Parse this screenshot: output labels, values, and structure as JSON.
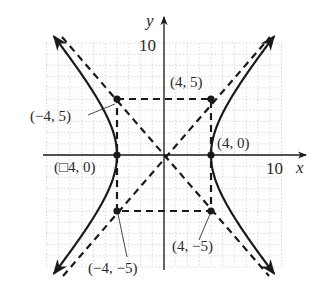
{
  "chart_data": {
    "type": "line",
    "title": "",
    "equation": "x^2/16 - y^2/25 = 1",
    "xlabel": "x",
    "ylabel": "y",
    "xlim": [
      -10,
      10
    ],
    "ylim": [
      -10,
      10
    ],
    "grid": true,
    "tick_labels": {
      "x": [
        "10"
      ],
      "y": [
        "10"
      ]
    },
    "series": [
      {
        "name": "hyperbola-right-branch",
        "style": "solid",
        "vertex": [
          4,
          0
        ]
      },
      {
        "name": "hyperbola-left-branch",
        "style": "solid",
        "vertex": [
          -4,
          0
        ]
      },
      {
        "name": "asymptote-positive",
        "style": "dashed",
        "slope": 1.25,
        "equation": "y = 5/4 x"
      },
      {
        "name": "asymptote-negative",
        "style": "dashed",
        "slope": -1.25,
        "equation": "y = -5/4 x"
      },
      {
        "name": "fundamental-rectangle",
        "style": "dashed",
        "corners": [
          [
            -4,
            5
          ],
          [
            4,
            5
          ],
          [
            4,
            -5
          ],
          [
            -4,
            -5
          ]
        ]
      }
    ],
    "points": [
      {
        "x": -4,
        "y": 5,
        "label": "(−4, 5)"
      },
      {
        "x": 4,
        "y": 5,
        "label": "(4, 5)"
      },
      {
        "x": 4,
        "y": 0,
        "label": "(4, 0)"
      },
      {
        "x": -4,
        "y": 0,
        "label": "(□4, 0)"
      },
      {
        "x": -4,
        "y": -5,
        "label": "(−4, −5)"
      },
      {
        "x": 4,
        "y": -5,
        "label": "(4, −5)"
      }
    ]
  },
  "labels": {
    "x_axis": "x",
    "y_axis": "y",
    "x_tick": "10",
    "y_tick": "10",
    "p_m4_5": "(−4, 5)",
    "p_4_5": "(4, 5)",
    "p_4_0": "(4, 0)",
    "p_m4_0": "(□4, 0)",
    "p_m4_m5": "(−4, −5)",
    "p_4_m5": "(4, −5)"
  },
  "colors": {
    "ink": "#1a1a1a",
    "grid": "#c8c8c8",
    "text": "#2a2a2a"
  }
}
